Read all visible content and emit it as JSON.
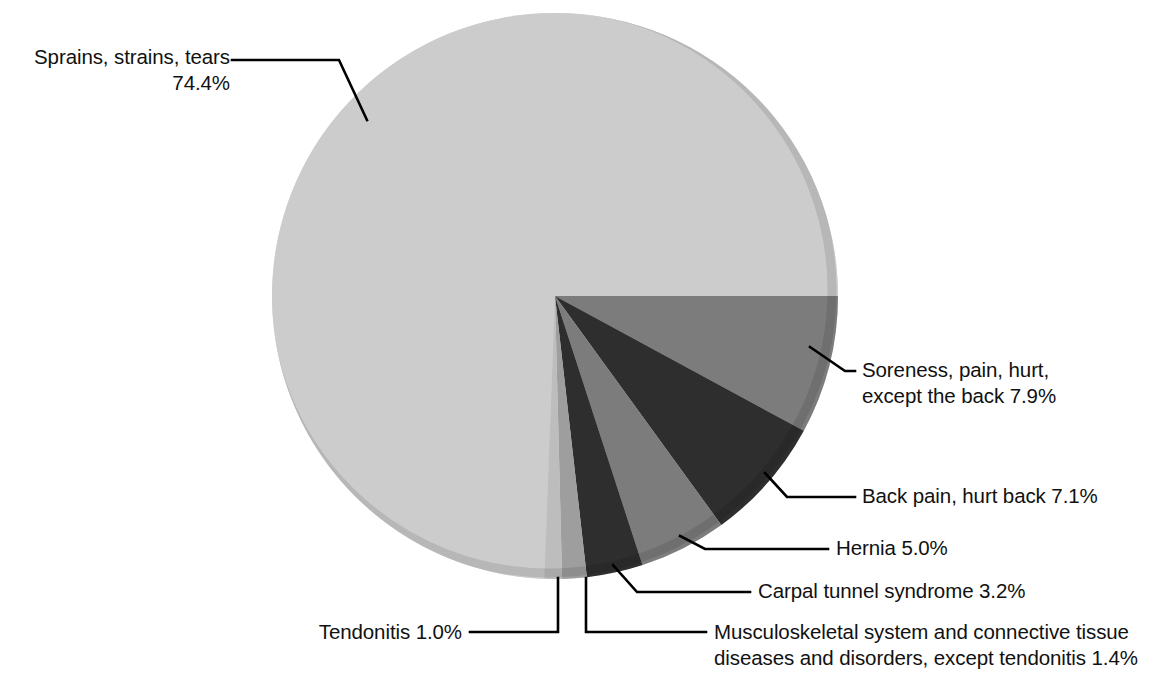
{
  "chart_data": {
    "type": "pie",
    "title": "",
    "subtitle": "",
    "xlabel": "",
    "ylabel": "",
    "legend_position": "callout-labels",
    "grid": false,
    "units": "percent",
    "start_angle_deg": 0,
    "direction": "clockwise",
    "categories": [
      "Sprains, strains, tears",
      "Soreness, pain, hurt, except the back",
      "Back pain, hurt back",
      "Hernia",
      "Carpal tunnel syndrome",
      "Musculoskeletal system and connective tissue diseases and disorders, except tendonitis",
      "Tendonitis"
    ],
    "values": [
      74.4,
      7.9,
      7.1,
      5.0,
      3.2,
      1.4,
      1.0
    ],
    "colors": [
      "#cccccc",
      "#7c7c7c",
      "#2e2e2e",
      "#7c7c7c",
      "#2e2e2e",
      "#9e9e9e",
      "#bdbdbd"
    ],
    "slices": [
      {
        "name": "soreness",
        "label_line1": "Soreness, pain, hurt,",
        "label_line2": "except the back 7.9%",
        "value": 7.9,
        "color": "#7c7c7c"
      },
      {
        "name": "back-pain",
        "label_line1": "Back pain, hurt back 7.1%",
        "label_line2": "",
        "value": 7.1,
        "color": "#2e2e2e"
      },
      {
        "name": "hernia",
        "label_line1": "Hernia 5.0%",
        "label_line2": "",
        "value": 5.0,
        "color": "#7c7c7c"
      },
      {
        "name": "carpal-tunnel",
        "label_line1": "Carpal tunnel syndrome 3.2%",
        "label_line2": "",
        "value": 3.2,
        "color": "#2e2e2e"
      },
      {
        "name": "musculoskeletal",
        "label_line1": "Musculoskeletal system and connective tissue",
        "label_line2": "diseases and disorders, except tendonitis 1.4%",
        "value": 1.4,
        "color": "#9e9e9e"
      },
      {
        "name": "tendonitis",
        "label_line1": "Tendonitis 1.0%",
        "label_line2": "",
        "value": 1.0,
        "color": "#bdbdbd"
      },
      {
        "name": "sprains",
        "label_line1": "Sprains, strains, tears",
        "label_line2": "74.4%",
        "value": 74.4,
        "color": "#cccccc"
      }
    ]
  },
  "labels": {
    "sprains_line1": "Sprains, strains, tears",
    "sprains_line2": "74.4%",
    "soreness_line1": "Soreness, pain, hurt,",
    "soreness_line2": "except the back 7.9%",
    "back_pain": "Back pain, hurt back 7.1%",
    "hernia": "Hernia 5.0%",
    "carpal_tunnel": "Carpal tunnel syndrome 3.2%",
    "musculoskeletal_line1": "Musculoskeletal system and connective tissue",
    "musculoskeletal_line2": "diseases and disorders, except tendonitis 1.4%",
    "tendonitis": "Tendonitis 1.0%"
  }
}
